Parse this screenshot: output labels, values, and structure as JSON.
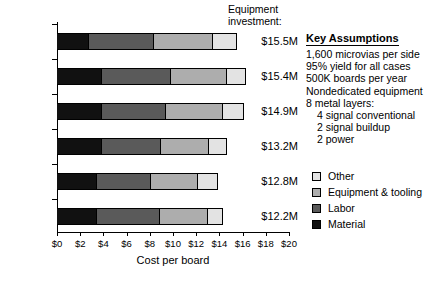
{
  "chart_data": {
    "type": "bar",
    "orientation": "horizontal",
    "stacked": true,
    "title": "",
    "xlabel": "Cost per board",
    "ylabel": "",
    "xlim": [
      0,
      20
    ],
    "xticks": [
      "$0",
      "$2",
      "$4",
      "$6",
      "$8",
      "$10",
      "$12",
      "$14",
      "$16",
      "$18",
      "$20"
    ],
    "xtick_values": [
      0,
      2,
      4,
      6,
      8,
      10,
      12,
      14,
      16,
      18,
      20
    ],
    "grid": false,
    "legend_position": "right",
    "categories": [
      "Laser 2/1",
      "Laser 3/1",
      "Laser 3/2",
      "Plasma 3",
      "Photo 3",
      "Photo 2"
    ],
    "series": [
      {
        "name": "Material",
        "color": "#111111",
        "values": [
          2.7,
          3.8,
          3.8,
          3.8,
          3.4,
          3.4
        ]
      },
      {
        "name": "Labor",
        "color": "#5a5a5a",
        "values": [
          5.6,
          5.9,
          5.5,
          5.1,
          4.6,
          5.4
        ]
      },
      {
        "name": "Equipment & tooling",
        "color": "#adadad",
        "values": [
          5.1,
          4.9,
          4.9,
          4.1,
          4.1,
          4.1
        ]
      },
      {
        "name": "Other",
        "color": "#e3e3e3",
        "values": [
          2.0,
          1.6,
          1.8,
          1.6,
          1.7,
          1.3
        ]
      }
    ],
    "totals": [
      15.4,
      16.2,
      16.0,
      14.6,
      13.8,
      14.2
    ],
    "annotations": {
      "equipment_investment": [
        "$15.5M",
        "$15.4M",
        "$14.9M",
        "$13.2M",
        "$12.8M",
        "$12.2M"
      ]
    }
  },
  "investment": {
    "heading_line1": "Equipment",
    "heading_line2": "investment:"
  },
  "assumptions": {
    "title": "Key Assumptions",
    "lines": [
      {
        "text": "1,600 microvias per side",
        "indent": false
      },
      {
        "text": "95% yield for all cases",
        "indent": false
      },
      {
        "text": "500K boards per year",
        "indent": false
      },
      {
        "text": "Nondedicated equipment",
        "indent": false
      },
      {
        "text": "8 metal layers:",
        "indent": false
      },
      {
        "text": "4 signal conventional",
        "indent": true
      },
      {
        "text": "2 signal buildup",
        "indent": true
      },
      {
        "text": "2 power",
        "indent": true
      }
    ]
  },
  "legend": {
    "items": [
      {
        "label": "Other",
        "color": "#e3e3e3"
      },
      {
        "label": "Equipment & tooling",
        "color": "#adadad"
      },
      {
        "label": "Labor",
        "color": "#5a5a5a"
      },
      {
        "label": "Material",
        "color": "#111111"
      }
    ]
  }
}
